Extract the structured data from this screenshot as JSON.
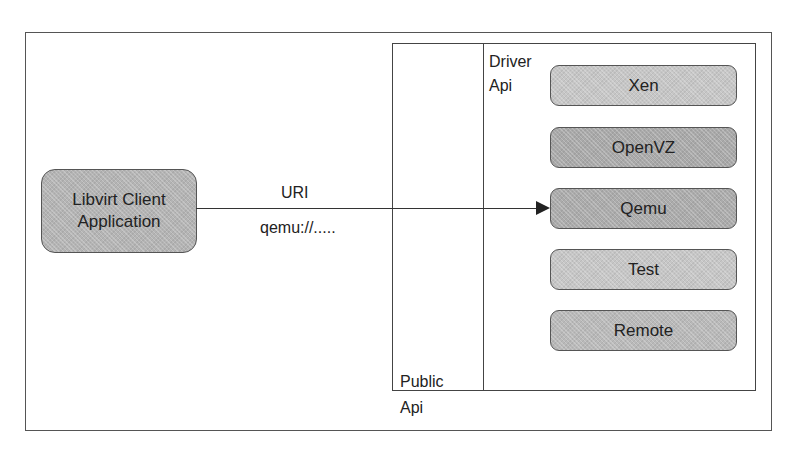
{
  "diagram": {
    "client": {
      "label_line1": "Libvirt Client",
      "label_line2": "Application",
      "fill": "#b4b4b4"
    },
    "connection": {
      "label_top": "URI",
      "label_bottom": "qemu://....."
    },
    "public_api": {
      "label_line1": "Public",
      "label_line2": "Api"
    },
    "driver_api": {
      "label_line1": "Driver",
      "label_line2": "Api"
    },
    "drivers": [
      {
        "name": "Xen",
        "fill": "#c6c6c6",
        "top": 65
      },
      {
        "name": "OpenVZ",
        "fill": "#a9a9a9",
        "top": 127
      },
      {
        "name": "Qemu",
        "fill": "#ababab",
        "top": 188
      },
      {
        "name": "Test",
        "fill": "#c6c6c6",
        "top": 249
      },
      {
        "name": "Remote",
        "fill": "#b9b9b9",
        "top": 310
      }
    ],
    "colors": {
      "line": "#333333",
      "frame": "#555555",
      "background": "#ffffff"
    }
  }
}
